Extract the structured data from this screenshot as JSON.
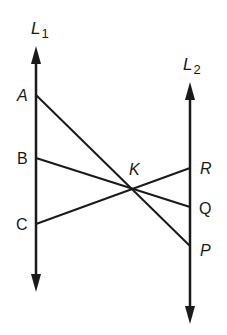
{
  "figure": {
    "stroke_color": "#1a1a1a",
    "background": "#ffffff",
    "lines": {
      "L1": {
        "label": "L",
        "subscript": "1",
        "x": 36,
        "y_top": 48,
        "y_bottom": 290
      },
      "L2": {
        "label": "L",
        "subscript": "2",
        "x": 190,
        "y_top": 84,
        "y_bottom": 322
      }
    },
    "points": {
      "A": {
        "label": "A",
        "x": 36,
        "y": 95
      },
      "B": {
        "label": "B",
        "x": 36,
        "y": 158
      },
      "C": {
        "label": "C",
        "x": 36,
        "y": 224
      },
      "R": {
        "label": "R",
        "x": 190,
        "y": 168
      },
      "Q": {
        "label": "Q",
        "x": 190,
        "y": 207
      },
      "P": {
        "label": "P",
        "x": 190,
        "y": 246
      },
      "K": {
        "label": "K",
        "x": 132,
        "y": 188
      }
    },
    "segments": [
      {
        "from": "A",
        "to": "P"
      },
      {
        "from": "B",
        "to": "Q"
      },
      {
        "from": "C",
        "to": "R"
      }
    ]
  }
}
